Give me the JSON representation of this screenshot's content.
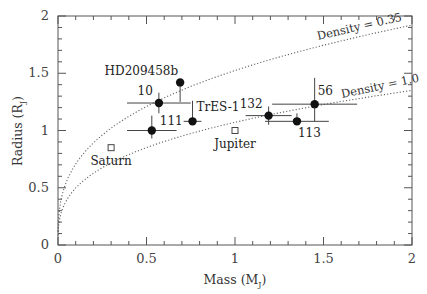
{
  "chart_data": {
    "type": "scatter",
    "title": "",
    "xlabel": "Mass (M_J)",
    "ylabel": "Radius (R_J)",
    "xlabel_main": "Mass",
    "xlabel_sub": "J",
    "ylabel_main": "Radius",
    "ylabel_sub": "J",
    "xlim": [
      0,
      2
    ],
    "ylim": [
      0,
      2
    ],
    "x_ticks": [
      "0",
      "0.5",
      "1",
      "1.5",
      "2"
    ],
    "y_ticks": [
      "0",
      "0.5",
      "1",
      "1.5",
      "2"
    ],
    "grid": false,
    "legend": null,
    "series": [
      {
        "name": "Transiting exoplanets",
        "marker": "filled-circle",
        "points": [
          {
            "label": "HD209458b",
            "x": 0.69,
            "y": 1.42,
            "xerr": 0.0,
            "yerr_up": 0.0,
            "yerr_down": 0.17
          },
          {
            "label": "10",
            "x": 0.57,
            "y": 1.24,
            "xerr": 0.18,
            "yerr_up": 0.09,
            "yerr_down": 0.09
          },
          {
            "label": "111",
            "x": 0.53,
            "y": 1.0,
            "xerr": 0.14,
            "yerr_up": 0.13,
            "yerr_down": 0.07
          },
          {
            "label": "TrES-1",
            "x": 0.76,
            "y": 1.08,
            "xerr": 0.05,
            "yerr_up": 0.18,
            "yerr_down": 0.0
          },
          {
            "label": "132",
            "x": 1.19,
            "y": 1.13,
            "xerr": 0.13,
            "yerr_up": 0.08,
            "yerr_down": 0.08
          },
          {
            "label": "113",
            "x": 1.35,
            "y": 1.08,
            "xerr": 0.18,
            "yerr_up": 0.07,
            "yerr_down": 0.0
          },
          {
            "label": "56",
            "x": 1.45,
            "y": 1.23,
            "xerr": 0.24,
            "yerr_up": 0.23,
            "yerr_down": 0.15
          }
        ]
      },
      {
        "name": "Solar system planets",
        "marker": "open-square",
        "points": [
          {
            "label": "Saturn",
            "x": 0.3,
            "y": 0.85
          },
          {
            "label": "Jupiter",
            "x": 1.0,
            "y": 1.0
          }
        ]
      }
    ],
    "curves": [
      {
        "label": "Density = 0.35",
        "style": "dotted",
        "formula": "R = (M/0.35)^(1/3) * scale"
      },
      {
        "label": "Density = 1.0",
        "style": "dotted",
        "formula": "R = (M/1.0)^(1/3) * scale"
      }
    ]
  }
}
